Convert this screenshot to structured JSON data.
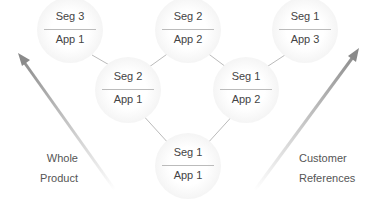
{
  "diagram": {
    "nodes": [
      {
        "id": "n1",
        "seg": "Seg 3",
        "app": "App 1",
        "x": 70,
        "y": 30
      },
      {
        "id": "n2",
        "seg": "Seg 2",
        "app": "App 2",
        "x": 188,
        "y": 30
      },
      {
        "id": "n3",
        "seg": "Seg 1",
        "app": "App 3",
        "x": 305,
        "y": 30
      },
      {
        "id": "n4",
        "seg": "Seg 2",
        "app": "App 1",
        "x": 128,
        "y": 90
      },
      {
        "id": "n5",
        "seg": "Seg 1",
        "app": "App 2",
        "x": 246,
        "y": 90
      },
      {
        "id": "n6",
        "seg": "Seg 1",
        "app": "App 1",
        "x": 188,
        "y": 166
      }
    ],
    "edges": [
      [
        "n1",
        "n4"
      ],
      [
        "n2",
        "n4"
      ],
      [
        "n2",
        "n5"
      ],
      [
        "n3",
        "n5"
      ],
      [
        "n4",
        "n6"
      ],
      [
        "n5",
        "n6"
      ]
    ],
    "left_label": {
      "line1": "Whole",
      "line2": "Product"
    },
    "right_label": {
      "line1": "Customer",
      "line2": "References"
    },
    "colors": {
      "arrow": "#8a8a8a",
      "edge": "#bbbbbb",
      "text": "#444444"
    }
  }
}
